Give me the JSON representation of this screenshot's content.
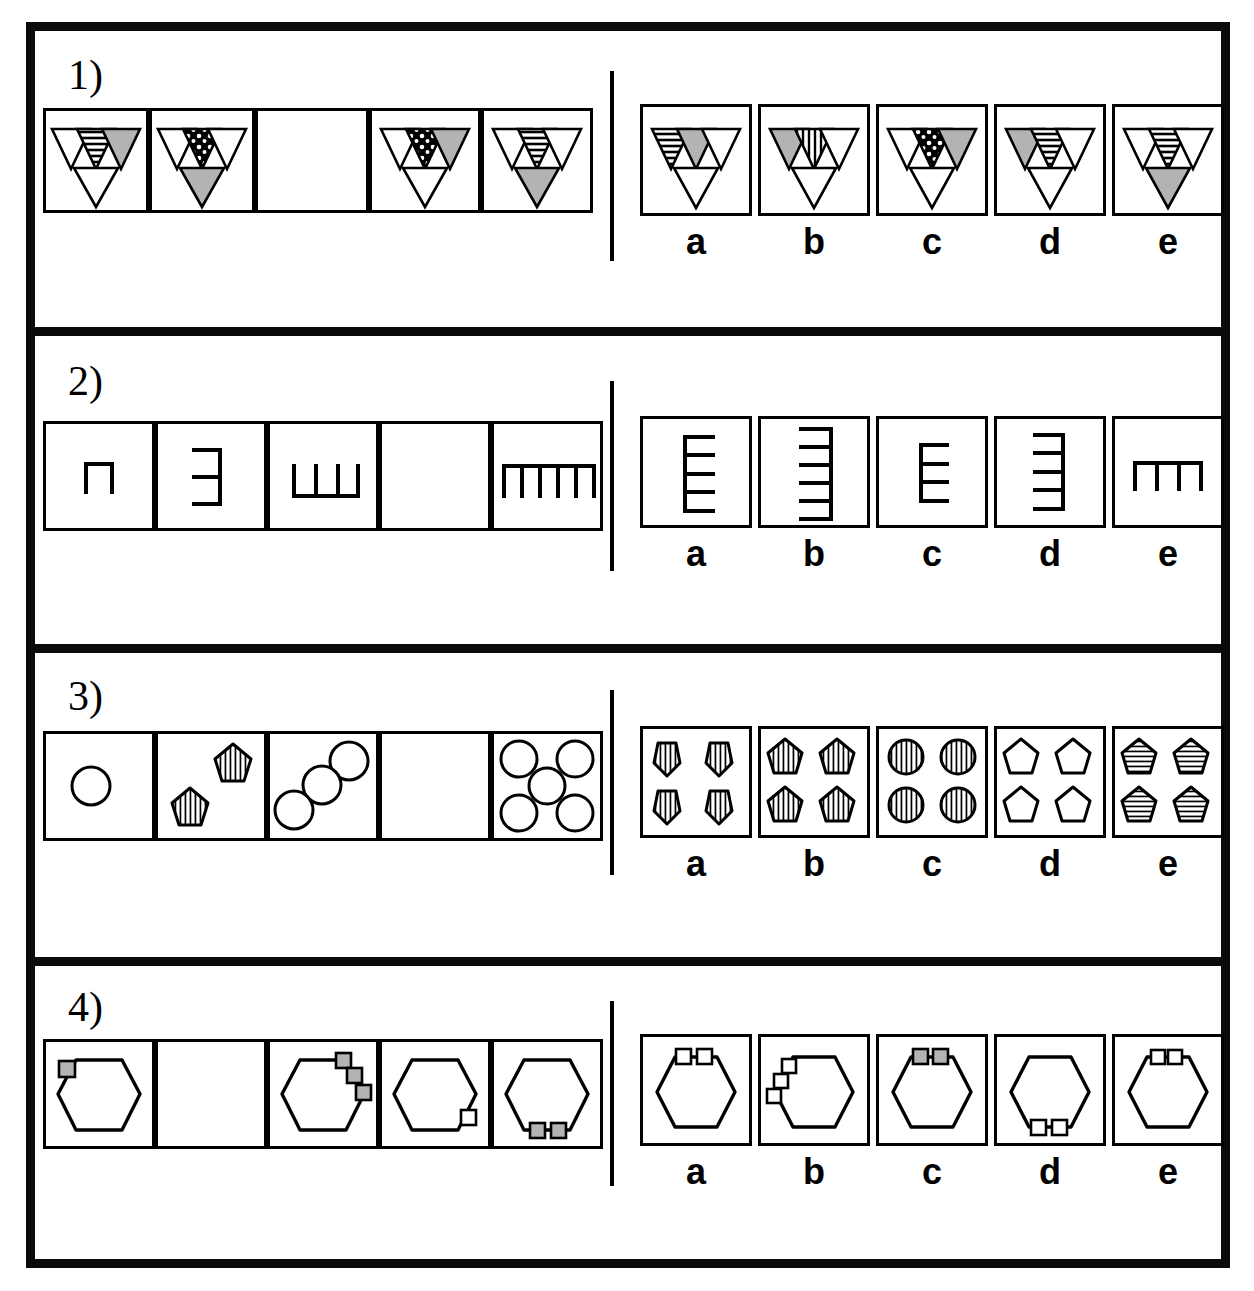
{
  "meta": {
    "kind": "non-verbal reasoning matrix puzzle",
    "problem_count": 4,
    "option_letters": [
      "a",
      "b",
      "c",
      "d",
      "e"
    ],
    "colors": {
      "ink": "#000000",
      "paper": "#ffffff",
      "gray_fill": "#b3b3b3",
      "frame": "#0a0a0a"
    }
  },
  "problems": [
    {
      "id": "problem-1",
      "number_label": "1)",
      "theme": "inverted-triangle clusters with changing fills",
      "stem_cells": [
        {
          "index": 1,
          "blank": false,
          "description": "cluster of four down-triangles: top-left white, top-middle horizontal stripes, top-right gray, bottom white",
          "parts": {
            "top_left": "white",
            "top_middle": "stripes-horizontal",
            "top_right": "gray",
            "bottom": "white"
          }
        },
        {
          "index": 2,
          "blank": false,
          "description": "top-left white, top-middle dotted/black, top-right white, bottom gray",
          "parts": {
            "top_left": "white",
            "top_middle": "dots",
            "top_right": "white",
            "bottom": "gray"
          }
        },
        {
          "index": 3,
          "blank": true,
          "description": "empty cell - the missing figure",
          "parts": {}
        },
        {
          "index": 4,
          "blank": false,
          "description": "top-left white, top-middle dotted/black, top-right gray, bottom white",
          "parts": {
            "top_left": "white",
            "top_middle": "dots",
            "top_right": "gray",
            "bottom": "white"
          }
        },
        {
          "index": 5,
          "blank": false,
          "description": "top-left white, top-middle horizontal stripes, top-right white, bottom gray",
          "parts": {
            "top_left": "white",
            "top_middle": "stripes-horizontal",
            "top_right": "white",
            "bottom": "gray"
          }
        }
      ],
      "options": [
        {
          "letter": "a",
          "parts": {
            "top_left": "stripes-horizontal",
            "top_middle": "gray",
            "top_right": "white",
            "bottom": "white"
          }
        },
        {
          "letter": "b",
          "parts": {
            "top_left": "gray",
            "top_middle": "stripes-vertical",
            "top_right": "white",
            "bottom": "white"
          }
        },
        {
          "letter": "c",
          "parts": {
            "top_left": "white",
            "top_middle": "dots",
            "top_right": "gray",
            "bottom": "white"
          }
        },
        {
          "letter": "d",
          "parts": {
            "top_left": "gray",
            "top_middle": "stripes-horizontal",
            "top_right": "white",
            "bottom": "white"
          }
        },
        {
          "letter": "e",
          "parts": {
            "top_left": "white",
            "top_middle": "stripes-horizontal",
            "top_right": "white",
            "bottom": "gray"
          }
        }
      ]
    },
    {
      "id": "problem-2",
      "number_label": "2)",
      "theme": "comb shapes: tooth count increases 1,2,3,4,5 while the comb rotates",
      "stem_cells": [
        {
          "index": 1,
          "blank": false,
          "teeth": 1,
          "orientation": "down",
          "description": "one tooth hanging down from a horizontal spine"
        },
        {
          "index": 2,
          "blank": false,
          "teeth": 2,
          "orientation": "left",
          "description": "spine vertical on the right, two teeth pointing left"
        },
        {
          "index": 3,
          "blank": false,
          "teeth": 3,
          "orientation": "up",
          "description": "spine horizontal at bottom, three teeth pointing up"
        },
        {
          "index": 4,
          "blank": true,
          "teeth": 4,
          "orientation": "right",
          "description": "empty cell - the missing figure"
        },
        {
          "index": 5,
          "blank": false,
          "teeth": 5,
          "orientation": "down",
          "description": "spine horizontal at top, five teeth pointing down"
        }
      ],
      "options": [
        {
          "letter": "a",
          "teeth": 5,
          "orientation": "right"
        },
        {
          "letter": "b",
          "teeth": 6,
          "orientation": "left"
        },
        {
          "letter": "c",
          "teeth": 4,
          "orientation": "right"
        },
        {
          "letter": "d",
          "teeth": 5,
          "orientation": "left"
        },
        {
          "letter": "e",
          "teeth": 4,
          "orientation": "down"
        }
      ]
    },
    {
      "id": "problem-3",
      "number_label": "3)",
      "theme": "counts increase 1,2,3,4,5; circles alternate with striped pentagons",
      "stem_cells": [
        {
          "index": 1,
          "blank": false,
          "count": 1,
          "shape": "circle",
          "fill": "white",
          "description": "one plain circle"
        },
        {
          "index": 2,
          "blank": false,
          "count": 2,
          "shape": "pentagon",
          "fill": "stripes-vertical",
          "description": "two vertically striped pentagons"
        },
        {
          "index": 3,
          "blank": false,
          "count": 3,
          "shape": "circle",
          "fill": "white",
          "description": "three plain circles"
        },
        {
          "index": 4,
          "blank": true,
          "count": 4,
          "shape": "pentagon",
          "fill": "stripes-vertical",
          "description": "empty cell - the missing figure"
        },
        {
          "index": 5,
          "blank": false,
          "count": 5,
          "shape": "circle",
          "fill": "white",
          "description": "five plain circles"
        }
      ],
      "options": [
        {
          "letter": "a",
          "count": 4,
          "shape": "pentagon-pointdown",
          "fill": "stripes-vertical"
        },
        {
          "letter": "b",
          "count": 4,
          "shape": "pentagon",
          "fill": "stripes-vertical"
        },
        {
          "letter": "c",
          "count": 4,
          "shape": "circle",
          "fill": "stripes-vertical"
        },
        {
          "letter": "d",
          "count": 4,
          "shape": "pentagon",
          "fill": "white"
        },
        {
          "letter": "e",
          "count": 4,
          "shape": "pentagon",
          "fill": "stripes-horizontal"
        }
      ]
    },
    {
      "id": "problem-4",
      "number_label": "4)",
      "theme": "hexagon with small squares attached at different positions/counts",
      "stem_cells": [
        {
          "index": 1,
          "blank": false,
          "squares": 1,
          "square_fill": "gray",
          "position": "upper-left-vertex",
          "description": "hexagon with one gray square on the upper-left vertex"
        },
        {
          "index": 2,
          "blank": true,
          "description": "empty cell - the missing figure"
        },
        {
          "index": 3,
          "blank": false,
          "squares": 3,
          "square_fill": "gray",
          "position": "upper-right-edge-staircase",
          "description": "hexagon with three gray squares stepping down the upper-right edge"
        },
        {
          "index": 4,
          "blank": false,
          "squares": 1,
          "square_fill": "white",
          "position": "lower-right-vertex",
          "description": "hexagon with one white square on the lower-right vertex"
        },
        {
          "index": 5,
          "blank": false,
          "squares": 2,
          "square_fill": "gray",
          "position": "bottom-edge",
          "description": "hexagon with two gray squares on the bottom edge"
        }
      ],
      "options": [
        {
          "letter": "a",
          "squares": 2,
          "square_fill": "white",
          "position": "top-edge"
        },
        {
          "letter": "b",
          "squares": 3,
          "square_fill": "white",
          "position": "upper-left-edge-staircase"
        },
        {
          "letter": "c",
          "squares": 2,
          "square_fill": "gray",
          "position": "top-edge"
        },
        {
          "letter": "d",
          "squares": 2,
          "square_fill": "white",
          "position": "bottom-edge"
        },
        {
          "letter": "e",
          "squares": 2,
          "square_fill": "white",
          "position": "top-edge-tight"
        }
      ]
    }
  ]
}
